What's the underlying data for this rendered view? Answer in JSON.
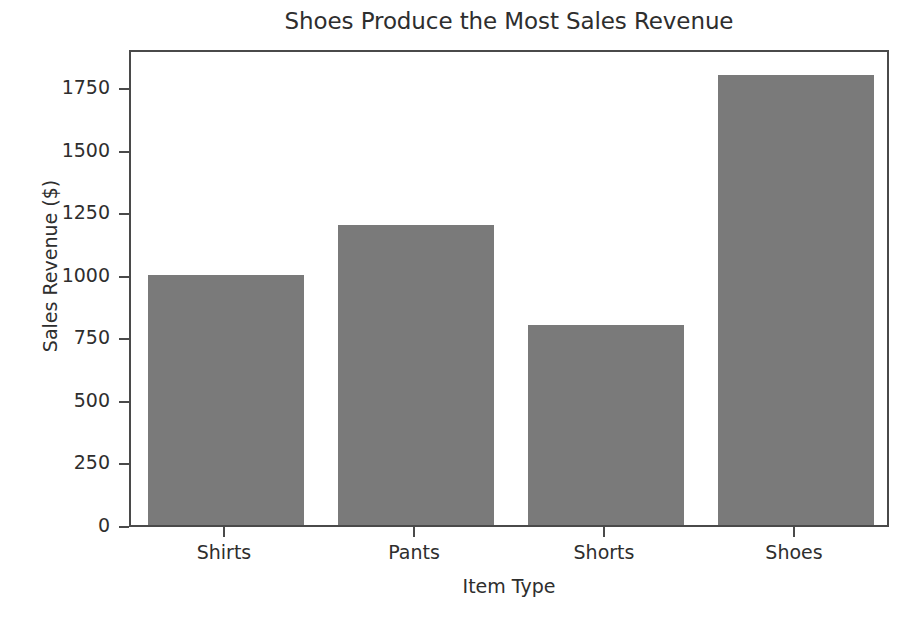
{
  "chart_data": {
    "type": "bar",
    "title": "Shoes Produce the Most Sales Revenue",
    "xlabel": "Item Type",
    "ylabel": "Sales Revenue ($)",
    "categories": [
      "Shirts",
      "Pants",
      "Shorts",
      "Shoes"
    ],
    "values": [
      1000,
      1200,
      800,
      1800
    ],
    "ylim": [
      0,
      1906
    ],
    "yticks": [
      0,
      250,
      500,
      750,
      1000,
      1250,
      1500,
      1750
    ],
    "ytick_labels": [
      "0",
      "250",
      "500",
      "750",
      "1000",
      "1250",
      "1500",
      "1750"
    ],
    "grid": false,
    "legend": null,
    "bar_color": "#7a7a7a",
    "axes_color": "#4a4a4a",
    "text_color": "#2e2e2e",
    "background_color": "#ffffff",
    "bar_width_fraction": 0.82
  }
}
